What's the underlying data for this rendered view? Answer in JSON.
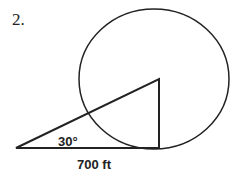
{
  "problem_number": "2.",
  "diagram": {
    "angle_label": "30°",
    "distance_label": "700 ft",
    "stroke_color": "#222222"
  }
}
